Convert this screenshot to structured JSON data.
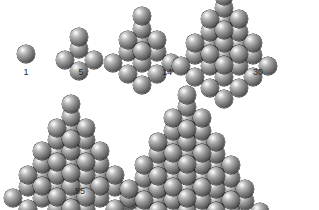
{
  "figure": {
    "name": "magic-number-cluster-sizes",
    "background_color": "#ffffff",
    "sphere_colors": {
      "highlight": "#ffffff",
      "midtone": "#7e7e7e",
      "shadow": "#101010",
      "outline": "#141414"
    },
    "label_color": "#2b2b2b"
  },
  "clusters": [
    {
      "id": "cluster-1",
      "label": "1",
      "count": 1,
      "label_visible": true,
      "row": "top",
      "origin": {
        "x": 17,
        "y": 45
      },
      "sphere_size": 18,
      "dx": 14.5,
      "dy": 11.0,
      "dz": 12.5,
      "layers": [
        {
          "rows": 1,
          "cols": 1
        }
      ],
      "label_pos": {
        "x": 11,
        "y": 67,
        "w": 30
      }
    },
    {
      "id": "cluster-5",
      "label": "5",
      "count": 5,
      "label_visible": true,
      "row": "top",
      "origin": {
        "x": 70,
        "y": 40
      },
      "sphere_size": 18,
      "dx": 14.5,
      "dy": 11.0,
      "dz": 12.5,
      "layers": [
        {
          "rows": 2,
          "cols": 2
        },
        {
          "rows": 1,
          "cols": 1
        }
      ],
      "label_pos": {
        "x": 66,
        "y": 67,
        "w": 30
      }
    },
    {
      "id": "cluster-14",
      "label": "14",
      "count": 14,
      "label_visible": true,
      "row": "top",
      "origin": {
        "x": 133,
        "y": 32
      },
      "sphere_size": 18,
      "dx": 14.5,
      "dy": 11.0,
      "dz": 12.5,
      "layers": [
        {
          "rows": 3,
          "cols": 3
        },
        {
          "rows": 2,
          "cols": 2
        },
        {
          "rows": 1,
          "cols": 1
        }
      ],
      "label_pos": {
        "x": 152,
        "y": 67,
        "w": 30
      }
    },
    {
      "id": "cluster-30",
      "label": "30",
      "count": 30,
      "label_visible": true,
      "row": "top",
      "origin": {
        "x": 215,
        "y": 24
      },
      "sphere_size": 18,
      "dx": 14.5,
      "dy": 11.0,
      "dz": 12.5,
      "layers": [
        {
          "rows": 4,
          "cols": 4
        },
        {
          "rows": 3,
          "cols": 3
        },
        {
          "rows": 2,
          "cols": 2
        },
        {
          "rows": 1,
          "cols": 1
        }
      ],
      "label_pos": {
        "x": 243,
        "y": 67,
        "w": 30
      }
    },
    {
      "id": "cluster-55",
      "label": "55",
      "count": 55,
      "label_visible": true,
      "row": "bottom",
      "origin": {
        "x": 62,
        "y": 145
      },
      "sphere_size": 18,
      "dx": 14.5,
      "dy": 11.0,
      "dz": 12.5,
      "layers": [
        {
          "rows": 5,
          "cols": 5
        },
        {
          "rows": 4,
          "cols": 4
        },
        {
          "rows": 3,
          "cols": 3
        },
        {
          "rows": 2,
          "cols": 2
        },
        {
          "rows": 1,
          "cols": 1
        }
      ],
      "label_pos": {
        "x": 65,
        "y": 186,
        "w": 30
      }
    },
    {
      "id": "cluster-91",
      "label": "",
      "count": 91,
      "label_visible": false,
      "row": "bottom",
      "origin": {
        "x": 178,
        "y": 148
      },
      "sphere_size": 18,
      "dx": 14.5,
      "dy": 11.0,
      "dz": 12.5,
      "layers": [
        {
          "rows": 6,
          "cols": 6
        },
        {
          "rows": 5,
          "cols": 5
        },
        {
          "rows": 4,
          "cols": 4
        },
        {
          "rows": 3,
          "cols": 3
        },
        {
          "rows": 2,
          "cols": 2
        },
        {
          "rows": 1,
          "cols": 1
        }
      ],
      "label_pos": {
        "x": 215,
        "y": 186,
        "w": 30
      }
    }
  ]
}
